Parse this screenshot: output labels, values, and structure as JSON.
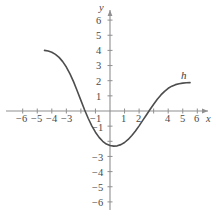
{
  "chart_data": {
    "type": "line",
    "title": "",
    "xlabel": "x",
    "ylabel": "y",
    "xlim": [
      -7,
      7
    ],
    "ylim": [
      -6.6,
      6.6
    ],
    "grid": false,
    "legend": "none",
    "axis_labels": {
      "x": "x",
      "y": "y"
    },
    "xticks": [
      -6,
      -5,
      -4,
      -3,
      -2,
      -1,
      1,
      2,
      3,
      4,
      5,
      6
    ],
    "xtick_labels": [
      "−6",
      "−5",
      "−4",
      "−3",
      "",
      "−1",
      "1",
      "2",
      "",
      "4",
      "5",
      "6"
    ],
    "yticks": [
      6,
      5,
      4,
      3,
      2,
      1,
      -1,
      -2,
      -3,
      -4,
      -5,
      -6
    ],
    "ytick_labels": [
      "6",
      "5",
      "4",
      "3",
      "2",
      "1",
      "−1",
      "",
      "−3",
      "−4",
      "−5",
      "−6"
    ],
    "series": [
      {
        "name": "h",
        "annotation": "h",
        "annotation_at": [
          5.0,
          2.55
        ],
        "color": "#4d4d4d",
        "x": [
          -4.5,
          -4.25,
          -4.0,
          -3.75,
          -3.5,
          -3.25,
          -3.0,
          -2.75,
          -2.5,
          -2.25,
          -2.0,
          -1.75,
          -1.5,
          -1.25,
          -1.0,
          -0.75,
          -0.5,
          -0.25,
          0.0,
          0.25,
          0.5,
          0.75,
          1.0,
          1.25,
          1.5,
          1.75,
          2.0,
          2.25,
          2.5,
          2.75,
          3.0,
          3.25,
          3.5,
          3.75,
          4.0,
          4.25,
          4.5,
          4.75,
          5.0,
          5.25,
          5.5
        ],
        "y": [
          4.0,
          3.96,
          3.88,
          3.74,
          3.54,
          3.26,
          2.9,
          2.45,
          1.92,
          1.32,
          0.7,
          0.08,
          -0.48,
          -0.98,
          -1.4,
          -1.74,
          -2.0,
          -2.18,
          -2.28,
          -2.32,
          -2.3,
          -2.22,
          -2.08,
          -1.88,
          -1.62,
          -1.32,
          -0.98,
          -0.62,
          -0.26,
          0.1,
          0.45,
          0.78,
          1.06,
          1.3,
          1.5,
          1.64,
          1.74,
          1.8,
          1.84,
          1.86,
          1.87
        ]
      }
    ],
    "colors": {
      "curve": "#4d4d4d",
      "axis": "#8a8a8a",
      "text": "#4a4a4a",
      "background": "#ffffff"
    }
  },
  "axis": {
    "x_name": "x",
    "y_name": "y"
  },
  "labels": {
    "x": [
      {
        "text": "−6",
        "left": 16,
        "top": 114
      },
      {
        "text": "−5",
        "left": 31,
        "top": 114
      },
      {
        "text": "−4",
        "left": 46,
        "top": 114
      },
      {
        "text": "−3",
        "left": 61,
        "top": 114
      },
      {
        "text": "−1",
        "left": 90,
        "top": 114
      },
      {
        "text": "1",
        "left": 121,
        "top": 114
      },
      {
        "text": "2",
        "left": 136,
        "top": 114
      },
      {
        "text": "4",
        "left": 165,
        "top": 114
      },
      {
        "text": "5",
        "left": 180,
        "top": 114
      },
      {
        "text": "6",
        "left": 194,
        "top": 114
      }
    ],
    "y": [
      {
        "text": "6",
        "left": 96,
        "top": 16
      },
      {
        "text": "5",
        "left": 96,
        "top": 31
      },
      {
        "text": "4",
        "left": 96,
        "top": 46
      },
      {
        "text": "3",
        "left": 96,
        "top": 61
      },
      {
        "text": "2",
        "left": 96,
        "top": 77
      },
      {
        "text": "1",
        "left": 96,
        "top": 92
      },
      {
        "text": "−1",
        "left": 92,
        "top": 123
      },
      {
        "text": "−3",
        "left": 92,
        "top": 153
      },
      {
        "text": "−4",
        "left": 92,
        "top": 168
      },
      {
        "text": "−5",
        "left": 92,
        "top": 183
      },
      {
        "text": "−6",
        "left": 92,
        "top": 198
      }
    ]
  },
  "curve_label": {
    "text": "h",
    "left": 181,
    "top": 70
  }
}
